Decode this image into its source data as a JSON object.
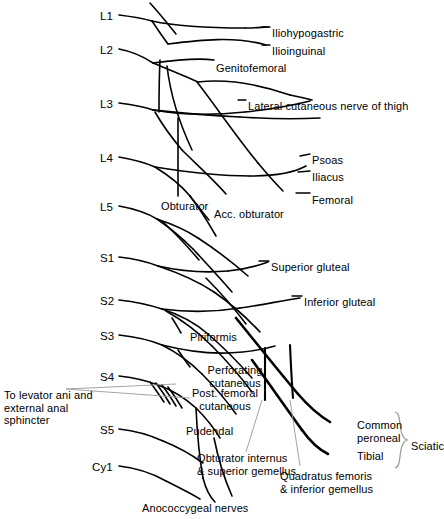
{
  "figure": {
    "background_color": "#ffffff",
    "line_color": "#000000",
    "leader_color": "#808080",
    "width": 444,
    "height": 519
  },
  "spinal_roots": [
    {
      "label": "L1",
      "x": 100,
      "y": 10
    },
    {
      "label": "L2",
      "x": 100,
      "y": 44
    },
    {
      "label": "L3",
      "x": 100,
      "y": 98
    },
    {
      "label": "L4",
      "x": 100,
      "y": 152
    },
    {
      "label": "L5",
      "x": 100,
      "y": 201
    },
    {
      "label": "S1",
      "x": 100,
      "y": 252
    },
    {
      "label": "S2",
      "x": 100,
      "y": 295
    },
    {
      "label": "S3",
      "x": 100,
      "y": 330
    },
    {
      "label": "S4",
      "x": 100,
      "y": 371
    },
    {
      "label": "S5",
      "x": 100,
      "y": 424
    },
    {
      "label": "Cy1",
      "x": 92,
      "y": 461
    }
  ],
  "nerve_labels": [
    {
      "name": "iliohypogastric",
      "text": "Iliohypogastric",
      "x": 272,
      "y": 27
    },
    {
      "name": "ilioinguinal",
      "text": "Ilioinguinal",
      "x": 272,
      "y": 45
    },
    {
      "name": "genitofemoral",
      "text": "Genitofemoral",
      "x": 216,
      "y": 62
    },
    {
      "name": "lateral-cutaneous-nerve-of-thigh",
      "text": "Lateral cutaneous nerve of thigh",
      "x": 248,
      "y": 100
    },
    {
      "name": "psoas",
      "text": "Psoas",
      "x": 312,
      "y": 154
    },
    {
      "name": "iliacus",
      "text": "Iliacus",
      "x": 312,
      "y": 171
    },
    {
      "name": "femoral",
      "text": "Femoral",
      "x": 312,
      "y": 194
    },
    {
      "name": "obturator",
      "text": "Obturator",
      "x": 161,
      "y": 200
    },
    {
      "name": "acc-obturator",
      "text": "Acc. obturator",
      "x": 214,
      "y": 208
    },
    {
      "name": "superior-gluteal",
      "text": "Superior gluteal",
      "x": 271,
      "y": 261
    },
    {
      "name": "inferior-gluteal",
      "text": "Inferior gluteal",
      "x": 304,
      "y": 296
    },
    {
      "name": "piriformis",
      "text": "Piriformis",
      "x": 190,
      "y": 331
    },
    {
      "name": "perforating-cutaneous",
      "text": "Perforating\ncutaneous",
      "x": 195,
      "y": 364
    },
    {
      "name": "post-femoral-cutaneous",
      "text": "Post. femoral\ncutaneous",
      "x": 179,
      "y": 387
    },
    {
      "name": "pudendal",
      "text": "Pudendal",
      "x": 186,
      "y": 425
    },
    {
      "name": "obturator-internus-superior-gemellus",
      "text": "Obturator internus\n& superior gemellus",
      "x": 197,
      "y": 452
    },
    {
      "name": "quadratus-femoris-inferior-gemellus",
      "text": "Quadratus femoris\n& inferior gemellus",
      "x": 280,
      "y": 470
    },
    {
      "name": "common-peroneal",
      "text": "Common\nperoneal",
      "x": 357,
      "y": 419
    },
    {
      "name": "tibial",
      "text": "Tibial",
      "x": 357,
      "y": 450
    },
    {
      "name": "sciatic",
      "text": "Sciatic",
      "x": 411,
      "y": 440
    },
    {
      "name": "anococcygeal-nerves",
      "text": "Anococcygeal nerves",
      "x": 142,
      "y": 502
    },
    {
      "name": "to-levator-ani-and-external-anal-sphincter",
      "text": "To levator ani and\nexternal anal\nsphincter",
      "x": 4,
      "y": 389
    }
  ]
}
